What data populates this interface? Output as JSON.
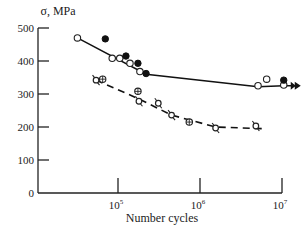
{
  "chart_data": {
    "type": "scatter",
    "title": "",
    "xlabel": "Number cycles",
    "ylabel": "σ, MPa",
    "xscale": "log",
    "xlim": [
      10000,
      10000000
    ],
    "ylim": [
      0,
      500
    ],
    "grid": false,
    "x_ticks": [
      {
        "value": 100000,
        "base": "10",
        "exp": "5"
      },
      {
        "value": 1000000,
        "base": "10",
        "exp": "6"
      },
      {
        "value": 10000000,
        "base": "10",
        "exp": "7"
      }
    ],
    "y_ticks": [
      0,
      100,
      200,
      300,
      400,
      500
    ],
    "series": [
      {
        "name": "upper-open",
        "marker": "open-circle",
        "points": [
          [
            32000,
            470
          ],
          [
            85000,
            408
          ],
          [
            105000,
            408
          ],
          [
            140000,
            393
          ],
          [
            185000,
            368
          ],
          [
            5100000,
            325
          ],
          [
            6500000,
            345
          ],
          [
            10500000,
            327
          ]
        ]
      },
      {
        "name": "upper-filled",
        "marker": "filled-circle",
        "points": [
          [
            70000,
            467
          ],
          [
            125000,
            415
          ],
          [
            175000,
            393
          ],
          [
            220000,
            362
          ],
          [
            10500000,
            342
          ]
        ]
      },
      {
        "name": "lower-open-tailed",
        "marker": "open-circle-tail",
        "points": [
          [
            54000,
            342
          ],
          [
            180000,
            278
          ],
          [
            310000,
            272
          ],
          [
            450000,
            236
          ],
          [
            1550000,
            197
          ],
          [
            4800000,
            203
          ]
        ]
      },
      {
        "name": "lower-crossed",
        "marker": "crossed-circle",
        "points": [
          [
            65000,
            345
          ],
          [
            175000,
            308
          ],
          [
            740000,
            215
          ]
        ]
      }
    ],
    "fit_lines": [
      {
        "name": "upper-fit",
        "style": "solid",
        "points": [
          [
            32000,
            470
          ],
          [
            220000,
            360
          ],
          [
            5100000,
            322
          ],
          [
            10500000,
            325
          ]
        ],
        "end_arrow": true
      },
      {
        "name": "lower-fit",
        "style": "dashed",
        "points": [
          [
            54000,
            342
          ],
          [
            180000,
            285
          ],
          [
            450000,
            236
          ],
          [
            1550000,
            200
          ],
          [
            5800000,
            195
          ]
        ]
      }
    ]
  }
}
